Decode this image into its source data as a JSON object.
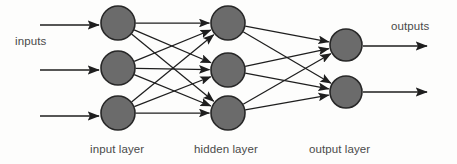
{
  "diagram": {
    "type": "neural-network-architecture",
    "width": 457,
    "height": 164,
    "background_color": "#fdfdfc",
    "node_fill_color": "#6b6b6b",
    "node_stroke_color": "#272727",
    "edge_color": "#1e1e1e",
    "label_color": "#4a4a4a"
  },
  "labels": {
    "inputs": "inputs",
    "outputs": "outputs",
    "input_layer": "input layer",
    "hidden_layer": "hidden layer",
    "output_layer": "output layer"
  },
  "layers": [
    {
      "id": "input",
      "label": "input layer",
      "node_count": 3,
      "center_x": 118,
      "radius": 17,
      "node_y": [
        23,
        68,
        113
      ]
    },
    {
      "id": "hidden",
      "label": "hidden layer",
      "node_count": 3,
      "center_x": 228,
      "radius": 17,
      "node_y": [
        23,
        70,
        113
      ]
    },
    {
      "id": "output",
      "label": "output layer",
      "node_count": 2,
      "center_x": 346,
      "radius": 16,
      "node_y": [
        45,
        92
      ]
    }
  ],
  "connections": {
    "input_to_hidden": "fully-connected",
    "input_to_hidden_count": 9,
    "hidden_to_output": "fully-connected",
    "hidden_to_output_count": 6
  },
  "input_arrows": [
    {
      "x1": 40,
      "y1": 25,
      "x2": 99,
      "y2": 25
    },
    {
      "x1": 40,
      "y1": 70,
      "x2": 99,
      "y2": 70
    },
    {
      "x1": 40,
      "y1": 116,
      "x2": 99,
      "y2": 116
    }
  ],
  "output_arrows": [
    {
      "x1": 363,
      "y1": 46,
      "x2": 427,
      "y2": 46
    },
    {
      "x1": 363,
      "y1": 92,
      "x2": 427,
      "y2": 92
    }
  ]
}
